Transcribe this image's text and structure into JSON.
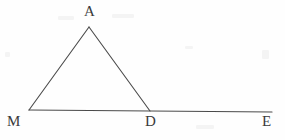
{
  "figure": {
    "type": "geometry-diagram",
    "width": 285,
    "height": 140,
    "background_color": "#fefefe",
    "stroke_color": "#4a4a4a",
    "label_color": "#3b3b3b",
    "stroke_width": 1.1,
    "points": {
      "A": {
        "label": "A",
        "x": 89,
        "y": 27
      },
      "M": {
        "label": "M",
        "x": 29,
        "y": 110
      },
      "D": {
        "label": "D",
        "x": 150,
        "y": 111
      },
      "E": {
        "label": "E",
        "x": 272,
        "y": 112
      }
    },
    "segments": [
      {
        "name": "MA",
        "from": "M",
        "to": "A"
      },
      {
        "name": "AD",
        "from": "A",
        "to": "D"
      },
      {
        "name": "ME",
        "from": "M",
        "to": "E"
      }
    ],
    "labels": [
      {
        "name": "label-A",
        "text": "A",
        "x": 84,
        "y": 4
      },
      {
        "name": "label-M",
        "text": "M",
        "x": 7,
        "y": 114
      },
      {
        "name": "label-D",
        "text": "D",
        "x": 145,
        "y": 114
      },
      {
        "name": "label-E",
        "text": "E",
        "x": 262,
        "y": 114
      }
    ]
  }
}
